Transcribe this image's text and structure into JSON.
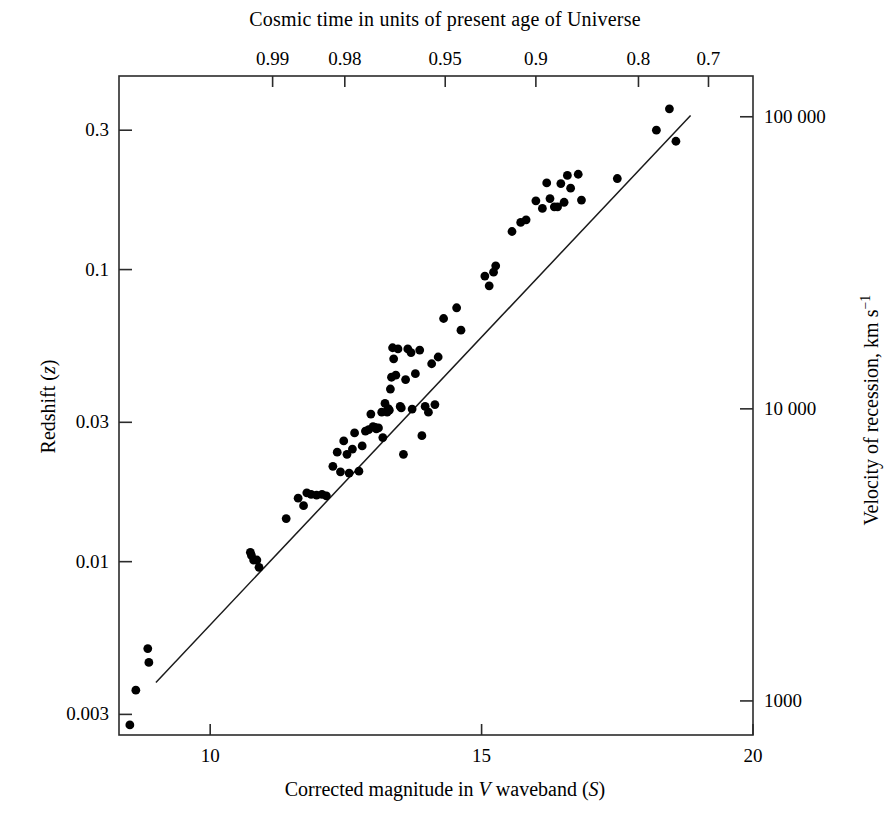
{
  "figure": {
    "top_axis_title": "Cosmic time in units of present age of Universe",
    "bottom_axis_title_html": "Corrected magnitude in V waveband (S)",
    "left_axis_title": "Redshift (z)",
    "right_axis_title_html": "Velocity of recession, km s-1",
    "line_color": "#1a1a1a",
    "point_color": "#000000",
    "frame_color": "#2b2b2b",
    "background": "#ffffff"
  },
  "chart_data": {
    "type": "scatter",
    "title": "",
    "xlabel": "Corrected magnitude in V waveband (S)",
    "ylabel": "Redshift (z)",
    "x_scale": "linear",
    "y_scale": "log",
    "xlim": [
      8.32,
      20.0
    ],
    "ylim": [
      0.00255,
      0.46
    ],
    "grid": false,
    "legend": null,
    "x_ticks": [
      10,
      15,
      20
    ],
    "x_tick_labels": [
      "10",
      "15",
      "20"
    ],
    "y_ticks": [
      0.003,
      0.01,
      0.03,
      0.1,
      0.3
    ],
    "y_tick_labels": [
      "0.003",
      "0.01",
      "0.03",
      "0.1",
      "0.3"
    ],
    "secondary_y_label": "Velocity of recession, km s-1",
    "secondary_y_ticks": [
      1000,
      10000,
      100000
    ],
    "secondary_y_tick_labels": [
      "1000",
      "10 000",
      "100 000"
    ],
    "secondary_x_label": "Cosmic time in units of present age of Universe",
    "secondary_x_ticks": [
      0.99,
      0.98,
      0.95,
      0.9,
      0.8,
      0.7
    ],
    "secondary_x_tick_labels": [
      "0.99",
      "0.98",
      "0.95",
      "0.9",
      "0.8",
      "0.7"
    ],
    "secondary_x_tick_magnitudes": [
      11.15,
      12.48,
      14.33,
      16.0,
      17.89,
      19.18
    ],
    "fit_line": {
      "x": [
        9.0,
        18.85
      ],
      "y": [
        0.00386,
        0.337
      ]
    },
    "points": [
      {
        "x": 8.52,
        "y": 0.00276
      },
      {
        "x": 8.63,
        "y": 0.00363
      },
      {
        "x": 8.85,
        "y": 0.00504
      },
      {
        "x": 8.87,
        "y": 0.00452
      },
      {
        "x": 10.74,
        "y": 0.01076
      },
      {
        "x": 10.76,
        "y": 0.0105
      },
      {
        "x": 10.8,
        "y": 0.01013
      },
      {
        "x": 10.86,
        "y": 0.01013
      },
      {
        "x": 10.9,
        "y": 0.00956
      },
      {
        "x": 11.4,
        "y": 0.01405
      },
      {
        "x": 11.62,
        "y": 0.0165
      },
      {
        "x": 11.72,
        "y": 0.01555
      },
      {
        "x": 11.78,
        "y": 0.0172
      },
      {
        "x": 11.86,
        "y": 0.017
      },
      {
        "x": 11.96,
        "y": 0.0169
      },
      {
        "x": 12.06,
        "y": 0.017
      },
      {
        "x": 12.14,
        "y": 0.0168
      },
      {
        "x": 12.26,
        "y": 0.0212
      },
      {
        "x": 12.34,
        "y": 0.0237
      },
      {
        "x": 12.4,
        "y": 0.0203
      },
      {
        "x": 12.46,
        "y": 0.0259
      },
      {
        "x": 12.52,
        "y": 0.0233
      },
      {
        "x": 12.56,
        "y": 0.0201
      },
      {
        "x": 12.62,
        "y": 0.0243
      },
      {
        "x": 12.66,
        "y": 0.0276
      },
      {
        "x": 12.74,
        "y": 0.0204
      },
      {
        "x": 12.8,
        "y": 0.0249
      },
      {
        "x": 12.86,
        "y": 0.028
      },
      {
        "x": 12.92,
        "y": 0.0283
      },
      {
        "x": 12.96,
        "y": 0.032
      },
      {
        "x": 13.0,
        "y": 0.029
      },
      {
        "x": 13.04,
        "y": 0.0288
      },
      {
        "x": 13.06,
        "y": 0.0285
      },
      {
        "x": 13.1,
        "y": 0.0287
      },
      {
        "x": 13.16,
        "y": 0.0325
      },
      {
        "x": 13.18,
        "y": 0.0266
      },
      {
        "x": 13.22,
        "y": 0.0348
      },
      {
        "x": 13.26,
        "y": 0.0325
      },
      {
        "x": 13.28,
        "y": 0.0334
      },
      {
        "x": 13.3,
        "y": 0.033
      },
      {
        "x": 13.32,
        "y": 0.039
      },
      {
        "x": 13.34,
        "y": 0.0428
      },
      {
        "x": 13.36,
        "y": 0.054
      },
      {
        "x": 13.38,
        "y": 0.0495
      },
      {
        "x": 13.42,
        "y": 0.0435
      },
      {
        "x": 13.46,
        "y": 0.0535
      },
      {
        "x": 13.5,
        "y": 0.034
      },
      {
        "x": 13.52,
        "y": 0.0336
      },
      {
        "x": 13.56,
        "y": 0.0233
      },
      {
        "x": 13.6,
        "y": 0.042
      },
      {
        "x": 13.64,
        "y": 0.0535
      },
      {
        "x": 13.7,
        "y": 0.052
      },
      {
        "x": 13.72,
        "y": 0.0333
      },
      {
        "x": 13.78,
        "y": 0.044
      },
      {
        "x": 13.86,
        "y": 0.053
      },
      {
        "x": 13.9,
        "y": 0.027
      },
      {
        "x": 13.96,
        "y": 0.034
      },
      {
        "x": 14.02,
        "y": 0.0325
      },
      {
        "x": 14.08,
        "y": 0.0476
      },
      {
        "x": 14.14,
        "y": 0.0345
      },
      {
        "x": 14.2,
        "y": 0.0502
      },
      {
        "x": 14.3,
        "y": 0.068
      },
      {
        "x": 14.54,
        "y": 0.074
      },
      {
        "x": 14.62,
        "y": 0.062
      },
      {
        "x": 15.06,
        "y": 0.095
      },
      {
        "x": 15.14,
        "y": 0.088
      },
      {
        "x": 15.22,
        "y": 0.098
      },
      {
        "x": 15.26,
        "y": 0.103
      },
      {
        "x": 15.56,
        "y": 0.135
      },
      {
        "x": 15.72,
        "y": 0.145
      },
      {
        "x": 15.82,
        "y": 0.148
      },
      {
        "x": 16.0,
        "y": 0.172
      },
      {
        "x": 16.12,
        "y": 0.162
      },
      {
        "x": 16.2,
        "y": 0.198
      },
      {
        "x": 16.26,
        "y": 0.175
      },
      {
        "x": 16.34,
        "y": 0.164
      },
      {
        "x": 16.4,
        "y": 0.164
      },
      {
        "x": 16.46,
        "y": 0.197
      },
      {
        "x": 16.52,
        "y": 0.17
      },
      {
        "x": 16.58,
        "y": 0.21
      },
      {
        "x": 16.64,
        "y": 0.19
      },
      {
        "x": 16.78,
        "y": 0.212
      },
      {
        "x": 16.84,
        "y": 0.173
      },
      {
        "x": 17.5,
        "y": 0.205
      },
      {
        "x": 18.22,
        "y": 0.3
      },
      {
        "x": 18.46,
        "y": 0.355
      },
      {
        "x": 18.58,
        "y": 0.275
      }
    ]
  }
}
